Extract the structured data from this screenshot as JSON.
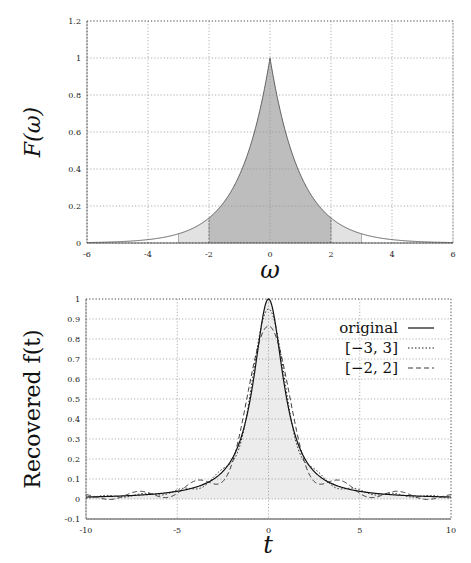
{
  "chart_data": [
    {
      "type": "area",
      "title": "",
      "xlabel": "ω",
      "ylabel": "F(ω)",
      "xlim": [
        -6,
        6
      ],
      "ylim": [
        0,
        1.2
      ],
      "xticks": [
        -6,
        -4,
        -2,
        0,
        2,
        4,
        6
      ],
      "xtick_labels": [
        "-6",
        "-4",
        "-2",
        "0",
        "2",
        "4",
        "6"
      ],
      "yticks": [
        0,
        0.2,
        0.4,
        0.6,
        0.8,
        1,
        1.2
      ],
      "ytick_labels": [
        "0",
        "0.2",
        "0.4",
        "0.6",
        "0.8",
        "1",
        "1.2"
      ],
      "grid": true,
      "function": "F(ω) = exp(-|ω|)",
      "shaded_regions": [
        {
          "name": "[-3,3]",
          "range": [
            -3,
            3
          ],
          "shade": "light"
        },
        {
          "name": "[-2,2]",
          "range": [
            -2,
            2
          ],
          "shade": "dark"
        }
      ]
    },
    {
      "type": "line",
      "title": "",
      "xlabel": "t",
      "ylabel": "Recovered f(t)",
      "xlim": [
        -10,
        10
      ],
      "ylim": [
        -0.1,
        1
      ],
      "xticks": [
        -10,
        -5,
        0,
        5,
        10
      ],
      "xtick_labels": [
        "-10",
        "-5",
        "0",
        "5",
        "10"
      ],
      "yticks": [
        -0.1,
        0,
        0.1,
        0.2,
        0.3,
        0.4,
        0.5,
        0.6,
        0.7,
        0.8,
        0.9,
        1
      ],
      "ytick_labels": [
        "-0.1",
        "0",
        "0.1",
        "0.2",
        "0.3",
        "0.4",
        "0.5",
        "0.6",
        "0.7",
        "0.8",
        "0.9",
        "1"
      ],
      "grid": true,
      "legend_position": "top-right",
      "series": [
        {
          "name": "original",
          "style": "solid",
          "function": "1/(1+t^2)",
          "filled": true
        },
        {
          "name": "[−3, 3]",
          "style": "dotted",
          "cutoff": 3
        },
        {
          "name": "[−2, 2]",
          "style": "dashed",
          "cutoff": 2
        }
      ]
    }
  ]
}
